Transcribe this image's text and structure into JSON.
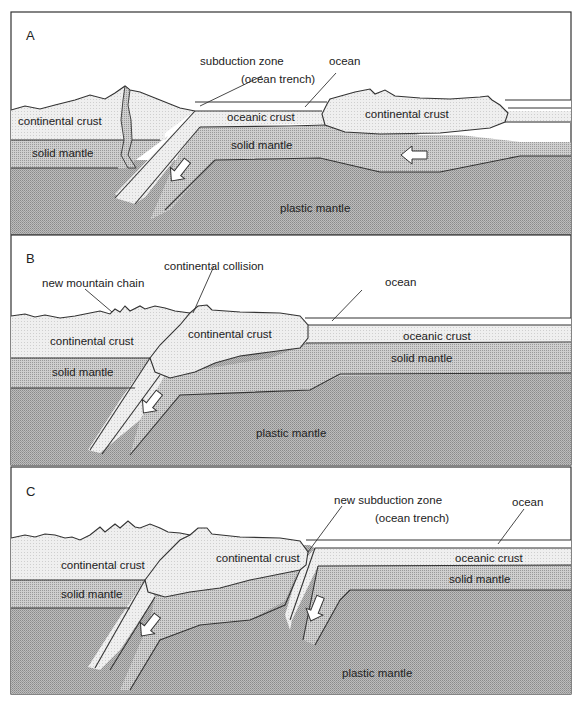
{
  "figure": {
    "colors": {
      "background": "#ffffff",
      "continental_crust": "#ededed",
      "oceanic_crust": "#f2f2f2",
      "solid_mantle": "#bdbdbd",
      "plastic_mantle": "#a9a9a9",
      "outline": "#333333",
      "arrow_fill": "#ffffff"
    }
  },
  "panels": [
    {
      "letter": "A",
      "labels": {
        "subduction_zone": "subduction zone",
        "ocean_trench": "(ocean trench)",
        "ocean": "ocean",
        "continental_crust_left": "continental crust",
        "oceanic_crust": "oceanic crust",
        "continental_crust_right": "continental crust",
        "solid_mantle_left": "solid mantle",
        "solid_mantle_right": "solid mantle",
        "plastic_mantle": "plastic mantle"
      }
    },
    {
      "letter": "B",
      "labels": {
        "new_mountain_chain": "new mountain chain",
        "continental_collision": "continental collision",
        "ocean": "ocean",
        "continental_crust_left": "continental crust",
        "continental_crust_center": "continental crust",
        "oceanic_crust": "oceanic crust",
        "solid_mantle_left": "solid mantle",
        "solid_mantle_right": "solid mantle",
        "plastic_mantle": "plastic mantle"
      }
    },
    {
      "letter": "C",
      "labels": {
        "new_subduction_zone": "new subduction zone",
        "ocean_trench": "(ocean trench)",
        "ocean": "ocean",
        "continental_crust_left": "continental crust",
        "continental_crust_center": "continental crust",
        "oceanic_crust": "oceanic crust",
        "solid_mantle_left": "solid mantle",
        "solid_mantle_right": "solid mantle",
        "plastic_mantle": "plastic mantle"
      }
    }
  ]
}
